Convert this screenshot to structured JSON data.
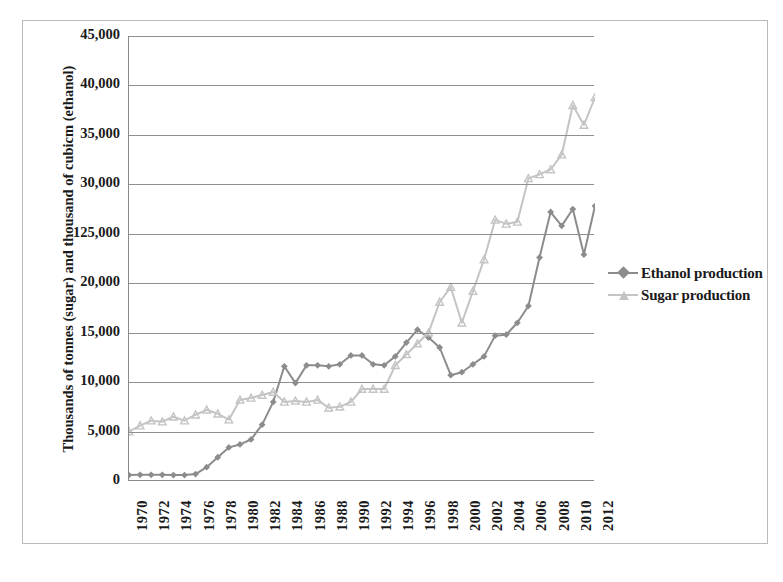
{
  "chart_data": {
    "type": "line",
    "title": "",
    "xlabel": "",
    "ylabel": "Thousands of tonnes (sugar) and thousand of cubicm (ethanol)",
    "ylim": [
      0,
      45000
    ],
    "ytick_labels": [
      "0",
      "5,000",
      "10,000",
      "15,000",
      "20,000",
      "125,000",
      "30,000",
      "35,000",
      "40,000",
      "45,000"
    ],
    "ytick_values": [
      0,
      5000,
      10000,
      15000,
      20000,
      25000,
      30000,
      35000,
      40000,
      45000
    ],
    "xtick_labels": [
      "1970",
      "1972",
      "1974",
      "1976",
      "1978",
      "1980",
      "1982",
      "1984",
      "1986",
      "1988",
      "1990",
      "1992",
      "1994",
      "1996",
      "1998",
      "2000",
      "2002",
      "2004",
      "2006",
      "2008",
      "2010",
      "2012"
    ],
    "x": [
      1970,
      1971,
      1972,
      1973,
      1974,
      1975,
      1976,
      1977,
      1978,
      1979,
      1980,
      1981,
      1982,
      1983,
      1984,
      1985,
      1986,
      1987,
      1988,
      1989,
      1990,
      1991,
      1992,
      1993,
      1994,
      1995,
      1996,
      1997,
      1998,
      1999,
      2000,
      2001,
      2002,
      2003,
      2004,
      2005,
      2006,
      2007,
      2008,
      2009,
      2010,
      2011,
      2012
    ],
    "xlim": [
      1970,
      2012
    ],
    "grid": true,
    "legend_position": "right",
    "series": [
      {
        "name": "Ethanol production",
        "color": "#8c8c8c",
        "marker": "diamond",
        "values": [
          600,
          620,
          620,
          620,
          600,
          600,
          700,
          1400,
          2400,
          3400,
          3700,
          4200,
          5700,
          8000,
          11600,
          9900,
          11700,
          11700,
          11600,
          11800,
          12700,
          12700,
          11800,
          11700,
          12600,
          14000,
          15300,
          14500,
          13500,
          10700,
          11000,
          11800,
          12600,
          14700,
          14800,
          16000,
          17700,
          22600,
          27200,
          25800,
          27500,
          22900,
          27800
        ]
      },
      {
        "name": "Sugar production",
        "color": "#c4c4c4",
        "marker": "triangle",
        "values": [
          5000,
          5600,
          6100,
          6000,
          6500,
          6100,
          6700,
          7200,
          6800,
          6200,
          8200,
          8400,
          8700,
          9000,
          8000,
          8100,
          8000,
          8200,
          7400,
          7500,
          8000,
          9300,
          9300,
          9300,
          11700,
          12800,
          13900,
          15000,
          18100,
          19600,
          16000,
          19200,
          22400,
          26400,
          26000,
          26200,
          30600,
          31000,
          31500,
          33000,
          38000,
          36000,
          38800
        ]
      }
    ]
  },
  "legend": {
    "items": [
      {
        "label": "Ethanol production"
      },
      {
        "label": "Sugar production"
      }
    ]
  }
}
